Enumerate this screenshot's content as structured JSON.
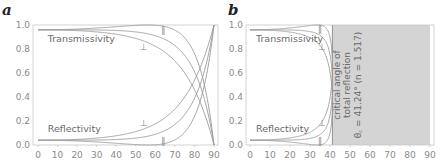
{
  "chart_data": [
    {
      "panel": "a",
      "type": "line",
      "title": "",
      "xlabel": "",
      "ylabel": "",
      "xlim": [
        0,
        90
      ],
      "ylim": [
        0.0,
        1.0
      ],
      "x_ticks": [
        0,
        10,
        20,
        30,
        40,
        50,
        60,
        70,
        80,
        90
      ],
      "y_ticks": [
        "0.0",
        "0.2",
        "0.4",
        "0.6",
        "0.8",
        "1.0"
      ],
      "grid": false,
      "n1": 1.0,
      "n2": 1.5,
      "labels": [
        {
          "text": "Transmissivity",
          "x": 5,
          "y": 0.86
        },
        {
          "text": "Reflectivity",
          "x": 5,
          "y": 0.11
        }
      ],
      "polarization_markers": [
        {
          "symbol": "⊥",
          "x": 54,
          "y": 0.82
        },
        {
          "symbol": "∥",
          "x": 64,
          "y": 0.96
        },
        {
          "symbol": "⊥",
          "x": 54,
          "y": 0.18
        },
        {
          "symbol": "∥",
          "x": 64,
          "y": 0.03
        }
      ],
      "series": [
        {
          "name": "Transmissivity ∥",
          "x": [
            0,
            20,
            40,
            56.3,
            70,
            80,
            90
          ],
          "values": [
            0.96,
            0.97,
            0.99,
            1.0,
            0.96,
            0.75,
            0.0
          ]
        },
        {
          "name": "Transmissivity (avg)",
          "x": [
            0,
            20,
            40,
            60,
            70,
            80,
            90
          ],
          "values": [
            0.96,
            0.96,
            0.95,
            0.91,
            0.83,
            0.61,
            0.0
          ]
        },
        {
          "name": "Transmissivity ⊥",
          "x": [
            0,
            20,
            40,
            60,
            70,
            80,
            90
          ],
          "values": [
            0.96,
            0.95,
            0.91,
            0.82,
            0.7,
            0.47,
            0.0
          ]
        },
        {
          "name": "Reflectivity ⊥",
          "x": [
            0,
            20,
            40,
            60,
            70,
            80,
            90
          ],
          "values": [
            0.04,
            0.05,
            0.09,
            0.18,
            0.3,
            0.53,
            1.0
          ]
        },
        {
          "name": "Reflectivity (avg)",
          "x": [
            0,
            20,
            40,
            60,
            70,
            80,
            90
          ],
          "values": [
            0.04,
            0.04,
            0.05,
            0.09,
            0.17,
            0.39,
            1.0
          ]
        },
        {
          "name": "Reflectivity ∥",
          "x": [
            0,
            20,
            40,
            56.3,
            70,
            80,
            90
          ],
          "values": [
            0.04,
            0.03,
            0.01,
            0.0,
            0.04,
            0.25,
            1.0
          ]
        }
      ]
    },
    {
      "panel": "b",
      "type": "line",
      "title": "",
      "xlabel": "",
      "ylabel": "",
      "xlim": [
        0,
        90
      ],
      "ylim": [
        0.0,
        1.0
      ],
      "x_ticks": [
        0,
        10,
        20,
        30,
        40,
        50,
        60,
        70,
        80,
        90
      ],
      "y_ticks": [
        "0.0",
        "0.2",
        "0.4",
        "0.6",
        "0.8",
        "1.0"
      ],
      "grid": false,
      "n1": 1.5,
      "n2": 1.0,
      "labels": [
        {
          "text": "Transmissivity",
          "x": 3,
          "y": 0.86
        },
        {
          "text": "Reflectivity",
          "x": 3,
          "y": 0.11
        }
      ],
      "polarization_markers": [
        {
          "symbol": "⊥",
          "x": 36,
          "y": 0.82
        },
        {
          "symbol": "∥",
          "x": 35,
          "y": 0.97
        },
        {
          "symbol": "⊥",
          "x": 36,
          "y": 0.18
        },
        {
          "symbol": "∥",
          "x": 35,
          "y": 0.03
        }
      ],
      "shaded_region": {
        "x_from": 41.24,
        "x_to": 90,
        "color": "#d4d4d4"
      },
      "annotation": {
        "line1": "critical angle of",
        "line2": "total reflection",
        "line3": "θ꜀ = 41.24° (n = 1.517)"
      },
      "series": [
        {
          "name": "Transmissivity ∥",
          "x": [
            0,
            20,
            33.7,
            38,
            40,
            41.24
          ],
          "values": [
            0.96,
            0.97,
            1.0,
            0.93,
            0.72,
            0.0
          ]
        },
        {
          "name": "Transmissivity (avg)",
          "x": [
            0,
            20,
            30,
            38,
            40,
            41.24
          ],
          "values": [
            0.96,
            0.95,
            0.93,
            0.8,
            0.62,
            0.0
          ]
        },
        {
          "name": "Transmissivity ⊥",
          "x": [
            0,
            20,
            30,
            38,
            40,
            41.24
          ],
          "values": [
            0.96,
            0.94,
            0.89,
            0.7,
            0.51,
            0.0
          ]
        },
        {
          "name": "Reflectivity ⊥",
          "x": [
            0,
            20,
            30,
            38,
            40,
            41.24
          ],
          "values": [
            0.04,
            0.06,
            0.11,
            0.3,
            0.49,
            1.0
          ]
        },
        {
          "name": "Reflectivity (avg)",
          "x": [
            0,
            20,
            30,
            38,
            40,
            41.24
          ],
          "values": [
            0.04,
            0.05,
            0.07,
            0.2,
            0.38,
            1.0
          ]
        },
        {
          "name": "Reflectivity ∥",
          "x": [
            0,
            20,
            33.7,
            38,
            40,
            41.24
          ],
          "values": [
            0.04,
            0.03,
            0.0,
            0.07,
            0.28,
            1.0
          ]
        }
      ]
    }
  ],
  "panels": {
    "a": {
      "letter": "a"
    },
    "b": {
      "letter": "b"
    }
  },
  "colors": {
    "curve": "#9a9a9a",
    "frame": "#c8c8c8",
    "shade": "#d4d4d4",
    "tick_text": "#8a8a8a"
  }
}
